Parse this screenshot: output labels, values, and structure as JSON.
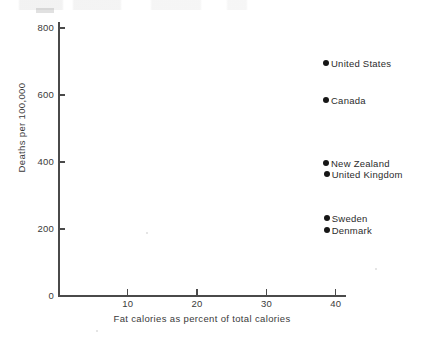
{
  "chart_data": {
    "type": "scatter",
    "title": "",
    "xlabel": "Fat calories as percent of total calories",
    "ylabel": "Deaths per 100,000",
    "xlim": [
      0,
      42
    ],
    "ylim": [
      0,
      830
    ],
    "xticks": [
      10,
      20,
      30,
      40
    ],
    "yticks": [
      0,
      200,
      400,
      600,
      800
    ],
    "xtick_labels": [
      "10",
      "20",
      "30",
      "40"
    ],
    "ytick_labels": [
      "0",
      "200",
      "400",
      "600",
      "800"
    ],
    "grid": false,
    "legend": "none",
    "marker_color": "#161616",
    "axis_color": "#4a4a4a",
    "points": [
      {
        "label": "United States",
        "x": 38.6,
        "y": 695,
        "label_side": "right"
      },
      {
        "label": "Canada",
        "x": 38.6,
        "y": 585,
        "label_side": "right"
      },
      {
        "label": "New Zealand",
        "x": 38.6,
        "y": 397,
        "label_side": "right"
      },
      {
        "label": "United Kingdom",
        "x": 38.7,
        "y": 364,
        "label_side": "right"
      },
      {
        "label": "Sweden",
        "x": 38.7,
        "y": 233,
        "label_side": "right"
      },
      {
        "label": "Denmark",
        "x": 38.7,
        "y": 197,
        "label_side": "right"
      }
    ]
  }
}
